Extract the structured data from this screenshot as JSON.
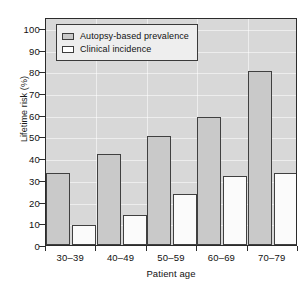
{
  "chart_data": {
    "type": "bar",
    "title": "",
    "xlabel": "Patient age",
    "ylabel": "Lifetime risk (%)",
    "categories": [
      "30–39",
      "40–49",
      "50–59",
      "60–69",
      "70–79"
    ],
    "ylim": [
      0,
      105
    ],
    "yticks": [
      0,
      10,
      20,
      30,
      40,
      50,
      60,
      70,
      80,
      90,
      100
    ],
    "ytick_labels": [
      "0",
      "10",
      "20",
      "30",
      "40",
      "50",
      "60",
      "70",
      "80",
      "90",
      "100"
    ],
    "grid": true,
    "legend_position": "upper left",
    "series": [
      {
        "name": "Autopsy-based prevalence",
        "color": "#c9c9c9",
        "values": [
          33,
          42,
          50,
          59,
          80
        ]
      },
      {
        "name": "Clinical incidence",
        "color": "#ffffff",
        "values": [
          9,
          14,
          23.5,
          32,
          33
        ]
      }
    ]
  },
  "colors": {
    "plot_background": "#d8d8d8",
    "gridline": "#ffffff",
    "axis": "#2b2b2b",
    "bar_edge": "#404040",
    "text": "#111111",
    "legend_background": "#eeeeee"
  }
}
